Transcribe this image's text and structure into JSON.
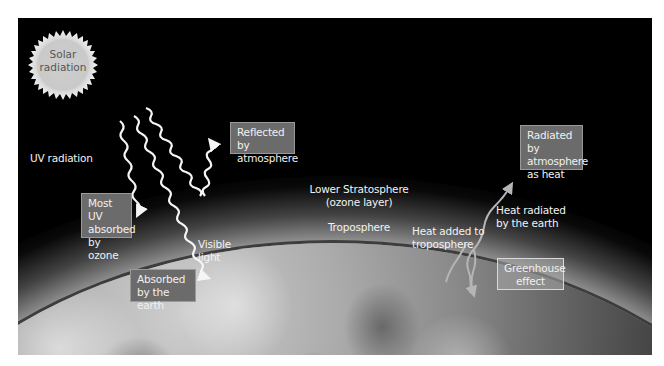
{
  "diagram": {
    "title": "",
    "sun": {
      "label": "Solar\nradiation",
      "icon": "sun-icon"
    },
    "labels": {
      "uv_radiation": "UV radiation",
      "visible_light": "Visible\nlight",
      "lower_stratosphere": "Lower Stratosphere\n(ozone layer)",
      "troposphere": "Troposphere",
      "heat_added": "Heat added to\ntroposphere",
      "heat_radiated": "Heat radiated\nby the earth"
    },
    "boxes": {
      "reflected": "Reflected by\natmosphere",
      "most_uv": "Most UV\nabsorbed\nby ozone",
      "absorbed_earth": "Absorbed\nby the earth",
      "radiated_heat": "Radiated by\natmosphere\nas heat",
      "greenhouse": "Greenhouse\neffect"
    },
    "arrows": [
      {
        "name": "uv-radiation-arrow",
        "meaning": "UV radiation absorbed by ozone"
      },
      {
        "name": "visible-light-arrow",
        "meaning": "Visible light absorbed by the earth"
      },
      {
        "name": "reflected-arrow",
        "meaning": "Radiation reflected by atmosphere"
      },
      {
        "name": "heat-radiated-arrow",
        "meaning": "Heat radiated by the earth"
      },
      {
        "name": "heat-added-arrow",
        "meaning": "Heat added to troposphere"
      },
      {
        "name": "greenhouse-arrow",
        "meaning": "Greenhouse effect returning heat"
      }
    ],
    "colors": {
      "background": "#000000",
      "box_fill": "#6b6b6b",
      "box_border": "#9a9a9a",
      "text": "#f2f2f2",
      "arrow": "#f5f5f5",
      "heat_arrow": "#b5b5b5"
    }
  }
}
